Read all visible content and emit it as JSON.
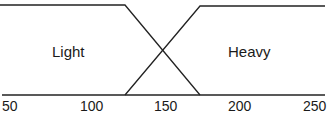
{
  "diagram": {
    "type": "fuzzy-membership",
    "sets": [
      {
        "name": "Light",
        "points": [
          [
            50,
            1
          ],
          [
            125,
            1
          ],
          [
            175,
            0
          ]
        ]
      },
      {
        "name": "Heavy",
        "points": [
          [
            125,
            0
          ],
          [
            175,
            1
          ],
          [
            250,
            1
          ]
        ]
      }
    ],
    "labels": {
      "light": "Light",
      "heavy": "Heavy"
    },
    "x_ticks": [
      "50",
      "100",
      "150",
      "200",
      "250"
    ],
    "caption": "Figure 1 ... (partially cropped)"
  }
}
